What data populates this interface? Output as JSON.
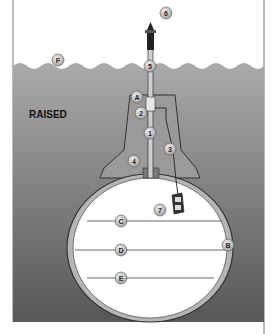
{
  "diagram": {
    "status_label": "RAISED",
    "colors": {
      "water_top": "#a9a9a9",
      "water_bottom": "#555555",
      "sky": "#ffffff",
      "hull_outline": "#333333",
      "hull_shell": "#b5b5b5",
      "interior": "#ffffff",
      "callout_fill": "#c8c8c8"
    },
    "callouts": [
      {
        "id": "6",
        "label": "6",
        "x": 166,
        "y": 13
      },
      {
        "id": "F",
        "label": "F",
        "x": 58,
        "y": 60
      },
      {
        "id": "5",
        "label": "5",
        "x": 150,
        "y": 66
      },
      {
        "id": "A",
        "label": "A",
        "x": 137,
        "y": 97
      },
      {
        "id": "2",
        "label": "2",
        "x": 141,
        "y": 113
      },
      {
        "id": "1",
        "label": "1",
        "x": 150,
        "y": 133
      },
      {
        "id": "3",
        "label": "3",
        "x": 170,
        "y": 149
      },
      {
        "id": "4",
        "label": "4",
        "x": 134,
        "y": 161
      },
      {
        "id": "7",
        "label": "7",
        "x": 160,
        "y": 210
      },
      {
        "id": "C",
        "label": "C",
        "x": 121,
        "y": 221
      },
      {
        "id": "B",
        "label": "B",
        "x": 228,
        "y": 245
      },
      {
        "id": "D",
        "label": "D",
        "x": 121,
        "y": 250
      },
      {
        "id": "E",
        "label": "E",
        "x": 121,
        "y": 278
      }
    ]
  }
}
